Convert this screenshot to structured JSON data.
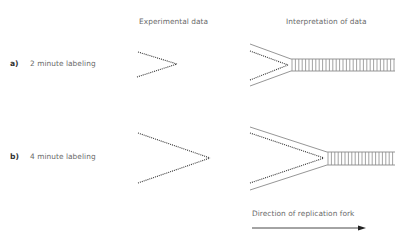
{
  "headers": {
    "experimental": "Experimental data",
    "interpretation": "Interpretation of data"
  },
  "rows": [
    {
      "letter": "a)",
      "label": "2 minute labeling"
    },
    {
      "letter": "b)",
      "label": "4 minute labeling"
    }
  ],
  "arrow": {
    "label": "Direction of replication fork"
  },
  "colors": {
    "text": "#6a6a6a",
    "dotted_strand": "#333333",
    "solid_strand": "#8a8a8a",
    "arrow": "#333333"
  }
}
